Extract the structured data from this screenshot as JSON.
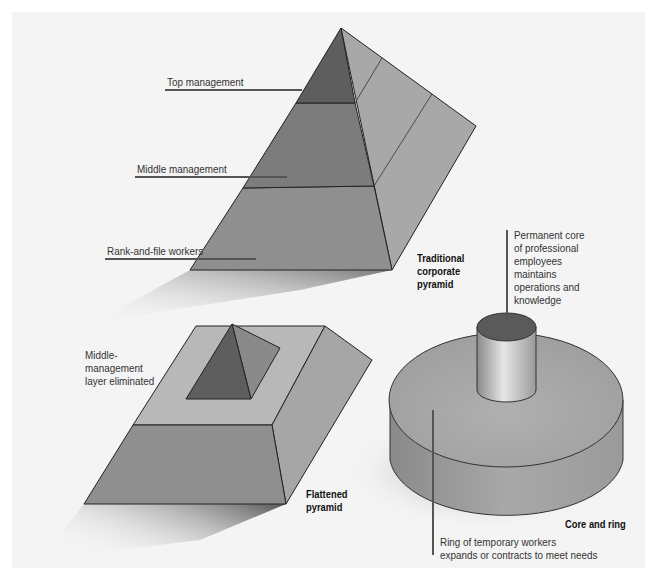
{
  "figure": {
    "colors": {
      "background": "#f4f4f4",
      "top_tier": "#5e5e5e",
      "middle_tier": "#7c7c7c",
      "base_tier": "#8f8f8f",
      "side_face": "#a6a6a6",
      "light_face": "#b8b8b8",
      "core_top": "#5a5a5a",
      "leader_line": "#555555"
    },
    "traditional_pyramid": {
      "caption": "Traditional\ncorporate\npyramid",
      "labels": {
        "top": "Top management",
        "middle": "Middle management",
        "base": "Rank-and-file workers"
      }
    },
    "flattened_pyramid": {
      "caption": "Flattened\npyramid",
      "label": "Middle-\nmanagement\nlayer eliminated"
    },
    "core_and_ring": {
      "caption": "Core and ring",
      "core_label": "Permanent core\nof professional\nemployees\nmaintains\noperations and\nknowledge",
      "ring_label": "Ring of temporary workers\nexpands or contracts to meet needs"
    }
  }
}
